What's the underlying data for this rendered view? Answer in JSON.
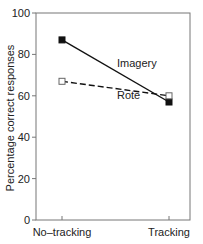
{
  "chart_data": {
    "type": "line",
    "title": "",
    "xlabel": "",
    "ylabel": "Percentage correct responses",
    "categories": [
      "No–tracking",
      "Tracking"
    ],
    "series": [
      {
        "name": "Imagery",
        "values": [
          87,
          57
        ],
        "line": "solid",
        "marker": "filled-square",
        "color": "#111111"
      },
      {
        "name": "Rote",
        "values": [
          67,
          60
        ],
        "line": "dashed",
        "marker": "open-square",
        "color": "#111111"
      }
    ],
    "ylim": [
      0,
      100
    ],
    "yticks": [
      "0",
      "20",
      "40",
      "60",
      "80",
      "100"
    ],
    "grid": false,
    "legend": "inline labels near lines"
  }
}
